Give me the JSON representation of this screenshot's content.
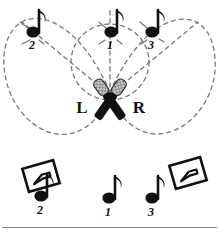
{
  "figure": {
    "background_color": "#ffffff",
    "ink_color": "#111111",
    "pattern_color": "#777777",
    "mic_head_color": "#b9b9b9",
    "width": 219,
    "height": 234
  },
  "channels": [
    {
      "id": "left",
      "label": "L",
      "x": 82,
      "y": 108
    },
    {
      "id": "right",
      "label": "R",
      "x": 137,
      "y": 108
    }
  ],
  "sources_top": [
    {
      "id": "source-2",
      "label": "2",
      "x": 33,
      "y": 32,
      "number_x": 32,
      "number_y": 47
    },
    {
      "id": "source-1",
      "label": "1",
      "x": 111,
      "y": 32,
      "number_x": 111,
      "number_y": 47
    },
    {
      "id": "source-3",
      "label": "3",
      "x": 152,
      "y": 32,
      "number_x": 152,
      "number_y": 47
    }
  ],
  "sources_bottom": [
    {
      "id": "source-2",
      "label": "2",
      "x": 41,
      "y": 196,
      "number_x": 40,
      "number_y": 213
    },
    {
      "id": "source-1",
      "label": "1",
      "x": 109,
      "y": 198,
      "number_x": 109,
      "number_y": 213
    },
    {
      "id": "source-3",
      "label": "3",
      "x": 152,
      "y": 198,
      "number_x": 152,
      "number_y": 213
    }
  ],
  "monitors": [
    {
      "id": "monitor-left",
      "x": 40,
      "y": 176,
      "rotation": -18
    },
    {
      "id": "monitor-right",
      "x": 187,
      "y": 172,
      "rotation": -18
    }
  ],
  "polar_patterns": [
    {
      "id": "left-lobe",
      "description": "left cardioid pickup lobe"
    },
    {
      "id": "right-lobe",
      "description": "right cardioid pickup lobe"
    },
    {
      "id": "center-overlap",
      "description": "center overlap region"
    }
  ],
  "divider": {
    "id": "bottom-rule",
    "y": 227,
    "color": "#8a8a8a"
  }
}
